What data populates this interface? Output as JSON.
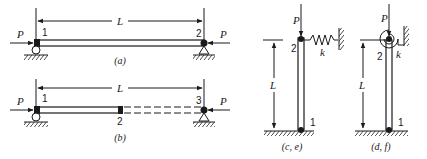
{
  "figure": {
    "panels": [
      {
        "id": "a",
        "caption": "(a)",
        "length_label": "L",
        "load_label_left": "P",
        "load_label_right": "P",
        "node_labels": [
          "1",
          "2"
        ],
        "description": "Horizontal beam with roller support at node 1 and pin support at node 2, axial loads P at both ends"
      },
      {
        "id": "b",
        "caption": "(b)",
        "length_label": "L",
        "load_label_left": "P",
        "load_label_right": "P",
        "node_labels": [
          "1",
          "2",
          "3"
        ],
        "description": "Horizontal beam from node 1 to 2 solid, dashed from 2 to 3, roller at 1, pin at 3"
      },
      {
        "id": "ce",
        "caption": "(c, e)",
        "length_label": "L",
        "load_label": "P",
        "spring_label": "k",
        "node_labels": [
          "2",
          "1"
        ],
        "description": "Vertical column fixed at base node 1, top node 2 with lateral translational spring k to wall"
      },
      {
        "id": "df",
        "caption": "(d, f)",
        "length_label": "L",
        "load_label": "P",
        "spring_label": "k",
        "node_labels": [
          "2",
          "1"
        ],
        "description": "Vertical column fixed at base node 1, top node 2 with rotational spring k to wall"
      }
    ],
    "colors": {
      "ink": "#1a1a1a",
      "background": "#ffffff"
    }
  }
}
